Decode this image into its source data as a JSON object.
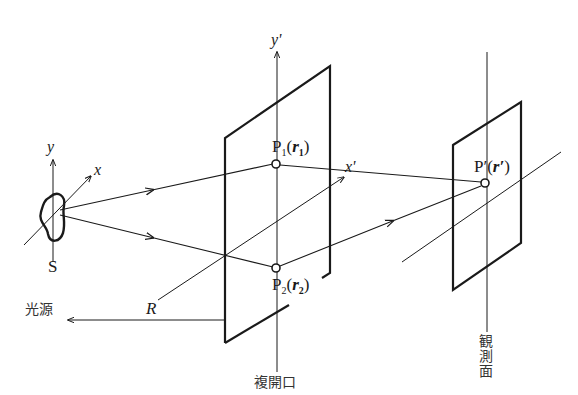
{
  "diagram": {
    "type": "double-aperture interference geometry",
    "source": {
      "label": "S",
      "axis_y_label": "y",
      "axis_x_label": "x",
      "name_label": "光源"
    },
    "distance": {
      "label": "R"
    },
    "aperture_plane": {
      "name_label": "複開口",
      "axis_y_label": "y'",
      "axis_x_label": "x'",
      "points": [
        {
          "name": "P",
          "sub": "1",
          "vec": "r",
          "vec_sub": "1"
        },
        {
          "name": "P",
          "sub": "2",
          "vec": "r",
          "vec_sub": "2"
        }
      ]
    },
    "observation_plane": {
      "name_label": "観測面",
      "point": {
        "name": "P′",
        "vec": "r′"
      }
    },
    "colors": {
      "line": "#1a1a1a",
      "background": "#ffffff"
    }
  }
}
